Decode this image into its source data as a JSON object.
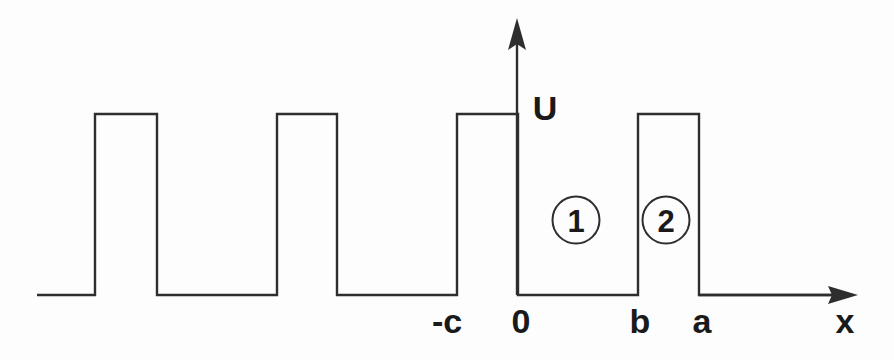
{
  "figure": {
    "background_color": "#fdfdfd",
    "line_color": "#2e2e2e",
    "text_color": "#1a1a1a"
  },
  "chart_data": {
    "type": "line",
    "xlabel": "x",
    "ylabel": "U",
    "grid": false,
    "legend": null,
    "x_axis": {
      "label": "x",
      "tick_labels": [
        "-c",
        "0",
        "b",
        "a"
      ],
      "tick_values": [
        -1.33,
        0,
        2.0,
        3.0
      ],
      "baseline_value": 0,
      "arrow": "right"
    },
    "y_axis": {
      "label": "U",
      "barrier_height": 1.0,
      "baseline_value": 0,
      "arrow": "up"
    },
    "series": [
      {
        "name": "U(x)",
        "step": true,
        "barriers": [
          {
            "index": 1,
            "x_start": -13.7,
            "x_end": -11.7,
            "height": 1.0
          },
          {
            "index": 2,
            "x_start": -7.7,
            "x_end": -5.7,
            "height": 1.0
          },
          {
            "index": 3,
            "x_start": -2.0,
            "x_end": 0.0,
            "height": 1.0
          },
          {
            "index": 4,
            "x_start": 4.0,
            "x_end": 6.0,
            "height": 1.0
          }
        ]
      }
    ],
    "region_markers": [
      {
        "label": "1",
        "x_center": 2.0,
        "y_center": 0.41,
        "shape": "circle",
        "meaning": "well region 0 < x < b"
      },
      {
        "label": "2",
        "x_center": 5.0,
        "y_center": 0.41,
        "shape": "circle",
        "meaning": "barrier region b < x < a"
      }
    ]
  },
  "geometry": {
    "baseline_y": 295,
    "barrier_top_y": 114,
    "baseline_x_start": 37,
    "x_axis_arrow_tip_x": 858,
    "y_axis_x": 517,
    "y_axis_arrow_tip_y": 18,
    "barriers_px": [
      {
        "left": 95,
        "right": 157
      },
      {
        "left": 277,
        "right": 337
      },
      {
        "left": 457,
        "right": 518
      },
      {
        "left": 638,
        "right": 699
      }
    ],
    "tick_label_positions_px": [
      {
        "text": "-c",
        "x": 447,
        "y": 333
      },
      {
        "text": "0",
        "x": 521,
        "y": 333
      },
      {
        "text": "b",
        "x": 640,
        "y": 333
      },
      {
        "text": "a",
        "x": 702,
        "y": 333
      }
    ],
    "region_circles_px": [
      {
        "cx": 576,
        "cy": 220,
        "r": 23.5,
        "label": "1"
      },
      {
        "cx": 666,
        "cy": 220,
        "r": 23.5,
        "label": "2"
      }
    ],
    "y_label_px": {
      "x": 545,
      "y": 120,
      "text": "U"
    },
    "x_label_px": {
      "x": 845,
      "y": 333,
      "text": "x"
    }
  },
  "labels": {
    "potential_axis": "U",
    "position_axis": "x",
    "tick_minus_c": "-c",
    "tick_zero": "0",
    "tick_b": "b",
    "tick_a": "a",
    "region_one": "1",
    "region_two": "2"
  }
}
